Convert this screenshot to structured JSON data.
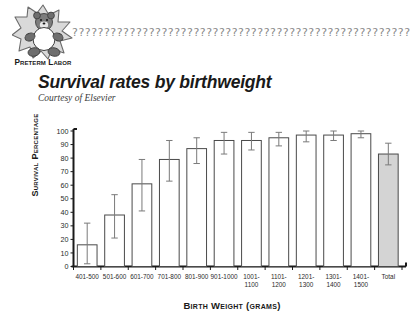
{
  "header": {
    "logo_wordmark": "Preterm Labor",
    "logo_icon": "teddy-bear-starburst-icon",
    "deco_pattern": "??????????????????????????????????????????????????????????????????"
  },
  "title": {
    "main": "Survival rates by birthweight",
    "subtitle": "Courtesy of Elsevier"
  },
  "chart_data": {
    "type": "bar",
    "title": "Survival rates by birthweight",
    "subtitle": "Courtesy of Elsevier",
    "xlabel": "Birth Weight (grams)",
    "ylabel": "Survival Percentage",
    "ylim": [
      0,
      100
    ],
    "yticks": [
      0,
      10,
      20,
      30,
      40,
      50,
      60,
      70,
      80,
      90,
      100
    ],
    "grid": false,
    "legend": null,
    "categories": [
      "401-500",
      "501-600",
      "601-700",
      "701-800",
      "801-900",
      "901-1000",
      "1001-1100",
      "1101-1200",
      "1201-1300",
      "1301-1400",
      "1401-1500",
      "Total"
    ],
    "category_lines": [
      [
        "401-500"
      ],
      [
        "501-600"
      ],
      [
        "601-700"
      ],
      [
        "701-800"
      ],
      [
        "801-900"
      ],
      [
        "901-1000"
      ],
      [
        "1001-",
        "1100"
      ],
      [
        "1101-",
        "1200"
      ],
      [
        "1201-",
        "1300"
      ],
      [
        "1301-",
        "1400"
      ],
      [
        "1401-",
        "1500"
      ],
      [
        "Total"
      ]
    ],
    "values": [
      16,
      38,
      61,
      79,
      87,
      93,
      93,
      95,
      97,
      97,
      98,
      83
    ],
    "error_low": [
      2,
      21,
      41,
      63,
      76,
      83,
      86,
      89,
      92,
      93,
      95,
      75
    ],
    "error_high": [
      32,
      53,
      79,
      93,
      95,
      99,
      99,
      99,
      100,
      100,
      100,
      91
    ],
    "bar_fill_default": "#ffffff",
    "bar_fill_total": "#d4d4d4",
    "bar_stroke": "#4a4a4a",
    "error_bar_color": "#7a7a7a",
    "axis_color": "#1a1a1a"
  }
}
